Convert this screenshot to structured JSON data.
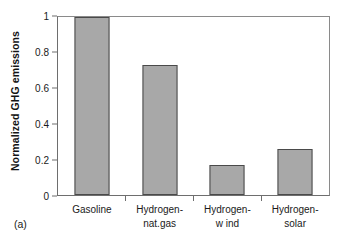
{
  "chart_data": {
    "type": "bar",
    "title": "",
    "subtitle": "",
    "xlabel": "",
    "ylabel": "Normalized GHG emissions",
    "categories": [
      "Gasoline",
      "Hydrogen-nat.gas",
      "Hydrogen-w ind",
      "Hydrogen-solar"
    ],
    "category_lines": [
      {
        "line1": "Gasoline",
        "line2": ""
      },
      {
        "line1": "Hydrogen-",
        "line2": "nat.gas"
      },
      {
        "line1": "Hydrogen-",
        "line2": "w ind"
      },
      {
        "line1": "Hydrogen-",
        "line2": "solar"
      }
    ],
    "values": [
      1.0,
      0.73,
      0.17,
      0.26
    ],
    "ylim": [
      0,
      1
    ],
    "xlim_note": "categorical",
    "ytick_labels": [
      "0",
      "0.2",
      "0.4",
      "0.6",
      "0.8",
      "1"
    ],
    "ytick_values": [
      0,
      0.2,
      0.4,
      0.6,
      0.8,
      1
    ],
    "grid": false,
    "legend": false,
    "legend_position": "none",
    "annotations": [
      "(a)"
    ],
    "bar_fill_color": "#a8a8a8",
    "bar_border_color": "#4a4a4a",
    "axis_color": "#6e6e6e",
    "background_color": "#ffffff"
  },
  "figure": {
    "panel_label": "(a)"
  }
}
